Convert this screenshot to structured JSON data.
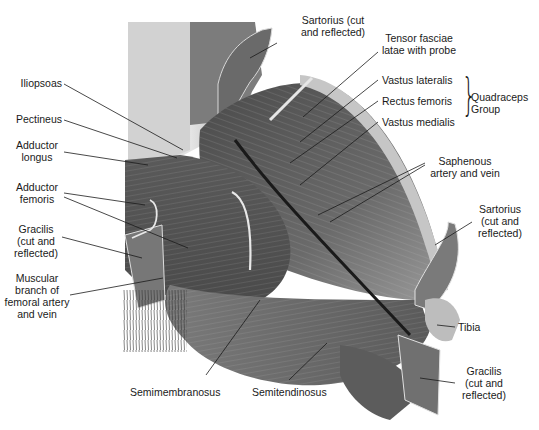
{
  "figure": {
    "colors": {
      "background": "#ffffff",
      "muscle_dark": "#3c3c3c",
      "muscle_mid": "#6e6e6e",
      "muscle_light": "#a8a8a8",
      "leader": "#1a1a1a"
    }
  },
  "labels": {
    "iliopsoas": "Iliopsoas",
    "pectineus": "Pectineus",
    "adductor_longus": [
      "Adductor",
      "longus"
    ],
    "adductor_femoris": [
      "Adductor",
      "femoris"
    ],
    "gracilis_left": [
      "Gracilis",
      "(cut and",
      "reflected)"
    ],
    "muscular_branch": [
      "Muscular",
      "branch of",
      "femoral artery",
      "and vein"
    ],
    "sartorius_top": [
      "Sartorius (cut",
      "and reflected)"
    ],
    "tensor": [
      "Tensor fasciae",
      "latae with probe"
    ],
    "vastus_lateralis": "Vastus lateralis",
    "rectus_femoris": "Rectus femoris",
    "vastus_medialis": "Vastus medialis",
    "quadriceps_group": [
      "Quadraceps",
      "Group"
    ],
    "saphenous": [
      "Saphenous",
      "artery and vein"
    ],
    "sartorius_right": [
      "Sartorius",
      "(cut and",
      "reflected)"
    ],
    "tibia": "Tibia",
    "gracilis_right": [
      "Gracilis",
      "(cut and",
      "reflected)"
    ],
    "semimembranosus": "Semimembranosus",
    "semitendinosus": "Semitendinosus"
  }
}
